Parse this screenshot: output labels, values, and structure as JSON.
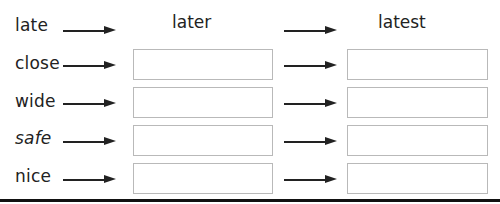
{
  "headers": {
    "col2": "later",
    "col3": "latest"
  },
  "rows": [
    {
      "word": "late",
      "has_boxes": false
    },
    {
      "word": "close",
      "has_boxes": true
    },
    {
      "word": "wide",
      "has_boxes": true
    },
    {
      "word": "safe",
      "has_boxes": true
    },
    {
      "word": "nice",
      "has_boxes": true
    }
  ],
  "colors": {
    "text": "#222222",
    "box_border": "#b9b9b9",
    "rule": "#111111"
  }
}
